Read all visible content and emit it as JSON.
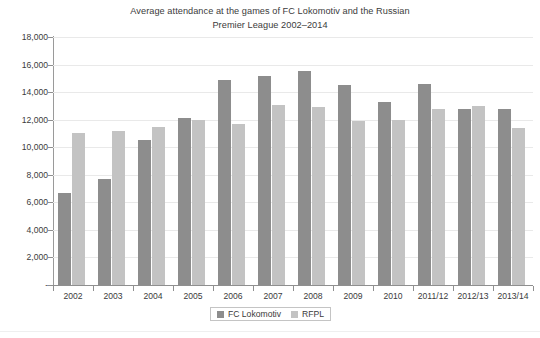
{
  "chart_data": {
    "type": "bar",
    "title": "Average attendance at the games of FC Lokomotiv and the Russian Premier League 2002–2014",
    "title_line1": "Average attendance at the games of FC Lokomotiv and the Russian",
    "title_line2": "Premier League 2002–2014",
    "xlabel": "",
    "ylabel": "",
    "ylim": [
      0,
      18000
    ],
    "grid": true,
    "legend_position": "bottom",
    "categories": [
      "2002",
      "2003",
      "2004",
      "2005",
      "2006",
      "2007",
      "2008",
      "2009",
      "2010",
      "2011/12",
      "2012/13",
      "2013/14"
    ],
    "series": [
      {
        "name": "FC Lokomotiv",
        "color": "#8d8d8d",
        "values": [
          6700,
          7700,
          10500,
          12100,
          14900,
          15200,
          15500,
          14550,
          13300,
          14600,
          12800,
          12800
        ]
      },
      {
        "name": "RFPL",
        "color": "#c3c3c3",
        "values": [
          11000,
          11200,
          11500,
          11950,
          11700,
          13100,
          12900,
          11900,
          12000,
          12800,
          13000,
          11400
        ]
      }
    ],
    "y_ticks": [
      {
        "value": 18000,
        "label": "18,000"
      },
      {
        "value": 16000,
        "label": "16,000"
      },
      {
        "value": 14000,
        "label": "14,000"
      },
      {
        "value": 12000,
        "label": "12,000"
      },
      {
        "value": 10000,
        "label": "10,000"
      },
      {
        "value": 8000,
        "label": "8,000"
      },
      {
        "value": 6000,
        "label": "6,000"
      },
      {
        "value": 4000,
        "label": "4,000"
      },
      {
        "value": 2000,
        "label": "2,000"
      },
      {
        "value": 0,
        "label": "-"
      }
    ]
  }
}
